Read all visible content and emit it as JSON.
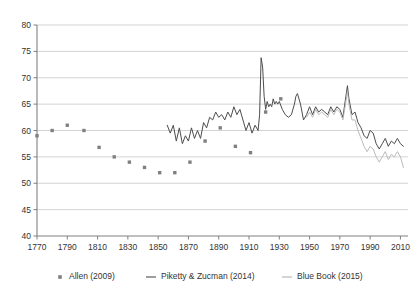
{
  "chart_data": {
    "type": "line",
    "title": "",
    "subtitle": "",
    "xlabel": "",
    "ylabel": "",
    "xlim": [
      1770,
      2015
    ],
    "ylim": [
      40,
      80
    ],
    "xticks": [
      1770,
      1790,
      1810,
      1830,
      1850,
      1870,
      1890,
      1910,
      1930,
      1950,
      1970,
      1990,
      2010
    ],
    "yticks": [
      40,
      45,
      50,
      55,
      60,
      65,
      70,
      75,
      80
    ],
    "grid": true,
    "legend_position": "bottom",
    "colors": {
      "allen": "#808080",
      "piketty_zucman": "#4d4d4d",
      "blue_book": "#b3b3b3",
      "gridline": "#c8c8c8",
      "axis": "#808080",
      "text": "#333333",
      "background": "#ffffff"
    },
    "series": [
      {
        "name": "Allen (2009)",
        "marker": "square",
        "style": "scatter",
        "points": [
          [
            1770,
            59.0
          ],
          [
            1780,
            60.0
          ],
          [
            1790,
            61.0
          ],
          [
            1801,
            60.0
          ],
          [
            1811,
            56.8
          ],
          [
            1821,
            55.0
          ],
          [
            1831,
            54.0
          ],
          [
            1841,
            53.0
          ],
          [
            1851,
            52.0
          ],
          [
            1861,
            52.0
          ],
          [
            1871,
            54.0
          ],
          [
            1881,
            58.0
          ],
          [
            1891,
            60.5
          ],
          [
            1901,
            57.0
          ],
          [
            1911,
            55.8
          ],
          [
            1921,
            63.5
          ],
          [
            1931,
            66.0
          ]
        ]
      },
      {
        "name": "Piketty & Zucman (2014)",
        "marker": "line",
        "style": "line",
        "points": [
          [
            1856,
            61.0
          ],
          [
            1858,
            59.5
          ],
          [
            1860,
            61.0
          ],
          [
            1862,
            58.0
          ],
          [
            1864,
            60.5
          ],
          [
            1866,
            57.5
          ],
          [
            1868,
            59.0
          ],
          [
            1870,
            58.0
          ],
          [
            1872,
            60.5
          ],
          [
            1874,
            58.5
          ],
          [
            1876,
            60.0
          ],
          [
            1878,
            58.5
          ],
          [
            1880,
            61.5
          ],
          [
            1882,
            60.5
          ],
          [
            1884,
            62.5
          ],
          [
            1886,
            62.0
          ],
          [
            1888,
            63.5
          ],
          [
            1890,
            62.5
          ],
          [
            1892,
            63.0
          ],
          [
            1894,
            62.0
          ],
          [
            1896,
            63.5
          ],
          [
            1898,
            62.5
          ],
          [
            1900,
            64.5
          ],
          [
            1902,
            63.0
          ],
          [
            1904,
            64.0
          ],
          [
            1906,
            62.0
          ],
          [
            1908,
            60.0
          ],
          [
            1910,
            61.5
          ],
          [
            1912,
            59.5
          ],
          [
            1914,
            61.0
          ],
          [
            1916,
            60.0
          ],
          [
            1917,
            63.0
          ],
          [
            1918,
            73.8
          ],
          [
            1919,
            72.0
          ],
          [
            1920,
            66.5
          ],
          [
            1921,
            64.0
          ],
          [
            1922,
            65.5
          ],
          [
            1923,
            64.5
          ],
          [
            1924,
            65.0
          ],
          [
            1925,
            64.5
          ],
          [
            1926,
            66.0
          ],
          [
            1927,
            65.0
          ],
          [
            1928,
            65.5
          ],
          [
            1929,
            65.0
          ],
          [
            1930,
            65.5
          ],
          [
            1932,
            64.0
          ],
          [
            1934,
            63.0
          ],
          [
            1936,
            62.5
          ],
          [
            1938,
            63.0
          ],
          [
            1940,
            65.0
          ],
          [
            1941,
            66.5
          ],
          [
            1942,
            67.0
          ],
          [
            1943,
            66.0
          ],
          [
            1944,
            65.0
          ],
          [
            1945,
            63.5
          ],
          [
            1946,
            62.0
          ],
          [
            1948,
            63.0
          ],
          [
            1950,
            64.5
          ],
          [
            1952,
            63.0
          ],
          [
            1954,
            64.5
          ],
          [
            1956,
            63.5
          ],
          [
            1958,
            64.0
          ],
          [
            1960,
            63.5
          ],
          [
            1962,
            63.0
          ],
          [
            1964,
            64.5
          ],
          [
            1966,
            63.5
          ],
          [
            1968,
            64.5
          ],
          [
            1970,
            64.0
          ],
          [
            1972,
            62.5
          ],
          [
            1974,
            66.5
          ],
          [
            1975,
            68.5
          ],
          [
            1976,
            66.0
          ],
          [
            1978,
            63.0
          ],
          [
            1980,
            63.5
          ],
          [
            1982,
            61.5
          ],
          [
            1984,
            60.5
          ],
          [
            1986,
            59.0
          ],
          [
            1988,
            58.5
          ],
          [
            1990,
            60.0
          ],
          [
            1992,
            59.5
          ],
          [
            1994,
            57.5
          ],
          [
            1996,
            56.5
          ],
          [
            1998,
            57.5
          ],
          [
            2000,
            58.5
          ],
          [
            2002,
            57.0
          ],
          [
            2004,
            58.0
          ],
          [
            2006,
            57.5
          ],
          [
            2008,
            58.5
          ],
          [
            2010,
            57.5
          ],
          [
            2012,
            57.0
          ]
        ]
      },
      {
        "name": "Blue Book (2015)",
        "marker": "line",
        "style": "line",
        "points": [
          [
            1948,
            62.5
          ],
          [
            1950,
            63.5
          ],
          [
            1952,
            62.5
          ],
          [
            1954,
            64.0
          ],
          [
            1956,
            63.0
          ],
          [
            1958,
            63.5
          ],
          [
            1960,
            63.0
          ],
          [
            1962,
            62.5
          ],
          [
            1964,
            64.0
          ],
          [
            1966,
            63.0
          ],
          [
            1968,
            64.0
          ],
          [
            1970,
            63.5
          ],
          [
            1972,
            62.0
          ],
          [
            1974,
            65.5
          ],
          [
            1975,
            67.5
          ],
          [
            1976,
            65.0
          ],
          [
            1978,
            62.0
          ],
          [
            1980,
            62.0
          ],
          [
            1982,
            60.0
          ],
          [
            1984,
            58.5
          ],
          [
            1986,
            57.0
          ],
          [
            1988,
            56.0
          ],
          [
            1990,
            57.0
          ],
          [
            1992,
            56.5
          ],
          [
            1994,
            55.0
          ],
          [
            1996,
            54.0
          ],
          [
            1998,
            55.0
          ],
          [
            2000,
            56.0
          ],
          [
            2002,
            54.5
          ],
          [
            2004,
            55.5
          ],
          [
            2006,
            55.0
          ],
          [
            2008,
            56.0
          ],
          [
            2010,
            55.0
          ],
          [
            2012,
            53.0
          ]
        ]
      }
    ],
    "legend": [
      {
        "label": "Allen (2009)",
        "marker": "square",
        "color": "#808080"
      },
      {
        "label": "Piketty & Zucman (2014)",
        "marker": "line",
        "color": "#4d4d4d"
      },
      {
        "label": "Blue Book (2015)",
        "marker": "line",
        "color": "#b3b3b3"
      }
    ]
  }
}
